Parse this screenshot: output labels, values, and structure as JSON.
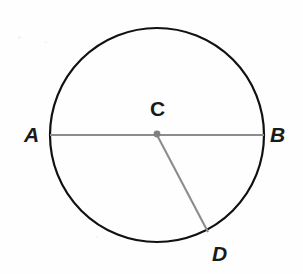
{
  "figure": {
    "background_color": "#fefefe",
    "width": 303,
    "height": 274,
    "circle": {
      "center_x": 157,
      "center_y": 135,
      "radius": 107,
      "stroke_color": "#111111",
      "stroke_width": 2.2,
      "fill": "none"
    },
    "center_dot": {
      "x": 157,
      "y": 134,
      "radius": 3.4,
      "color": "#808080"
    },
    "segments": [
      {
        "name": "diameter-ab",
        "from_label": "A",
        "to_label": "B",
        "x1": 50,
        "y1": 135,
        "x2": 264,
        "y2": 135,
        "color": "#8c8c8c",
        "width": 2.1
      },
      {
        "name": "radius-cd",
        "from_label": "C",
        "to_label": "D",
        "x1": 157,
        "y1": 135,
        "x2": 208,
        "y2": 232,
        "color": "#8c8c8c",
        "width": 2.1
      }
    ],
    "labels": {
      "a": "A",
      "b": "B",
      "c": "C",
      "d": "D"
    }
  },
  "chart_data": {
    "type": "diagram",
    "shape": "circle",
    "center": {
      "label": "C",
      "x": 157,
      "y": 135
    },
    "radius_px": 107,
    "points": [
      {
        "label": "A",
        "x": 50,
        "y": 135,
        "on_circle": true,
        "description": "left endpoint of diameter"
      },
      {
        "label": "B",
        "x": 264,
        "y": 135,
        "on_circle": true,
        "description": "right endpoint of diameter"
      },
      {
        "label": "C",
        "x": 157,
        "y": 135,
        "on_circle": false,
        "description": "center of circle"
      },
      {
        "label": "D",
        "x": 208,
        "y": 232,
        "on_circle": true,
        "description": "endpoint of radius CD"
      }
    ],
    "lines": [
      {
        "name": "AB",
        "type": "diameter",
        "endpoints": [
          "A",
          "B"
        ],
        "length_px": 214
      },
      {
        "name": "CD",
        "type": "radius",
        "endpoints": [
          "C",
          "D"
        ],
        "length_px": 107
      }
    ],
    "angles": [
      {
        "name": "BCD",
        "vertex": "C",
        "rays": [
          "B",
          "D"
        ],
        "approx_degrees": 62
      },
      {
        "name": "ACD",
        "vertex": "C",
        "rays": [
          "A",
          "D"
        ],
        "approx_degrees": 118
      }
    ]
  }
}
